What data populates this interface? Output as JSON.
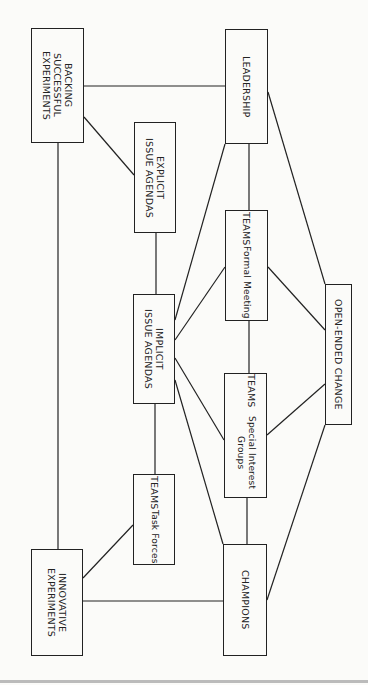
{
  "diagram": {
    "nodes": [
      {
        "id": "backing",
        "title": "BACKING\nSUCCESSFUL\nEXPERIMENTS",
        "subtitle": ""
      },
      {
        "id": "leadership",
        "title": "LEADERSHIP",
        "subtitle": ""
      },
      {
        "id": "explicit",
        "title": "EXPLICIT\nISSUE AGENDAS",
        "subtitle": ""
      },
      {
        "id": "teams_formal",
        "title": "TEAMS",
        "subtitle": "Formal Meeting"
      },
      {
        "id": "open_ended",
        "title": "OPEN-ENDED CHANGE",
        "subtitle": ""
      },
      {
        "id": "implicit",
        "title": "IMPLICIT\nISSUE AGENDAS",
        "subtitle": ""
      },
      {
        "id": "teams_sig",
        "title": "TEAMS",
        "subtitle": "Special Interest Groups"
      },
      {
        "id": "teams_task",
        "title": "TEAMS",
        "subtitle": "Task Forces"
      },
      {
        "id": "innovative",
        "title": "INNOVATIVE\nEXPERIMENTS",
        "subtitle": ""
      },
      {
        "id": "champions",
        "title": "CHAMPIONS",
        "subtitle": ""
      }
    ],
    "edges": [
      [
        "backing",
        "leadership"
      ],
      [
        "backing",
        "explicit"
      ],
      [
        "backing",
        "innovative"
      ],
      [
        "explicit",
        "implicit"
      ],
      [
        "leadership",
        "teams_formal"
      ],
      [
        "leadership",
        "implicit"
      ],
      [
        "leadership",
        "open_ended"
      ],
      [
        "teams_formal",
        "implicit"
      ],
      [
        "teams_formal",
        "open_ended"
      ],
      [
        "teams_formal",
        "teams_sig"
      ],
      [
        "implicit",
        "teams_sig"
      ],
      [
        "implicit",
        "champions"
      ],
      [
        "implicit",
        "teams_task"
      ],
      [
        "teams_sig",
        "open_ended"
      ],
      [
        "teams_sig",
        "champions"
      ],
      [
        "open_ended",
        "champions"
      ],
      [
        "teams_task",
        "innovative"
      ],
      [
        "innovative",
        "champions"
      ]
    ]
  }
}
